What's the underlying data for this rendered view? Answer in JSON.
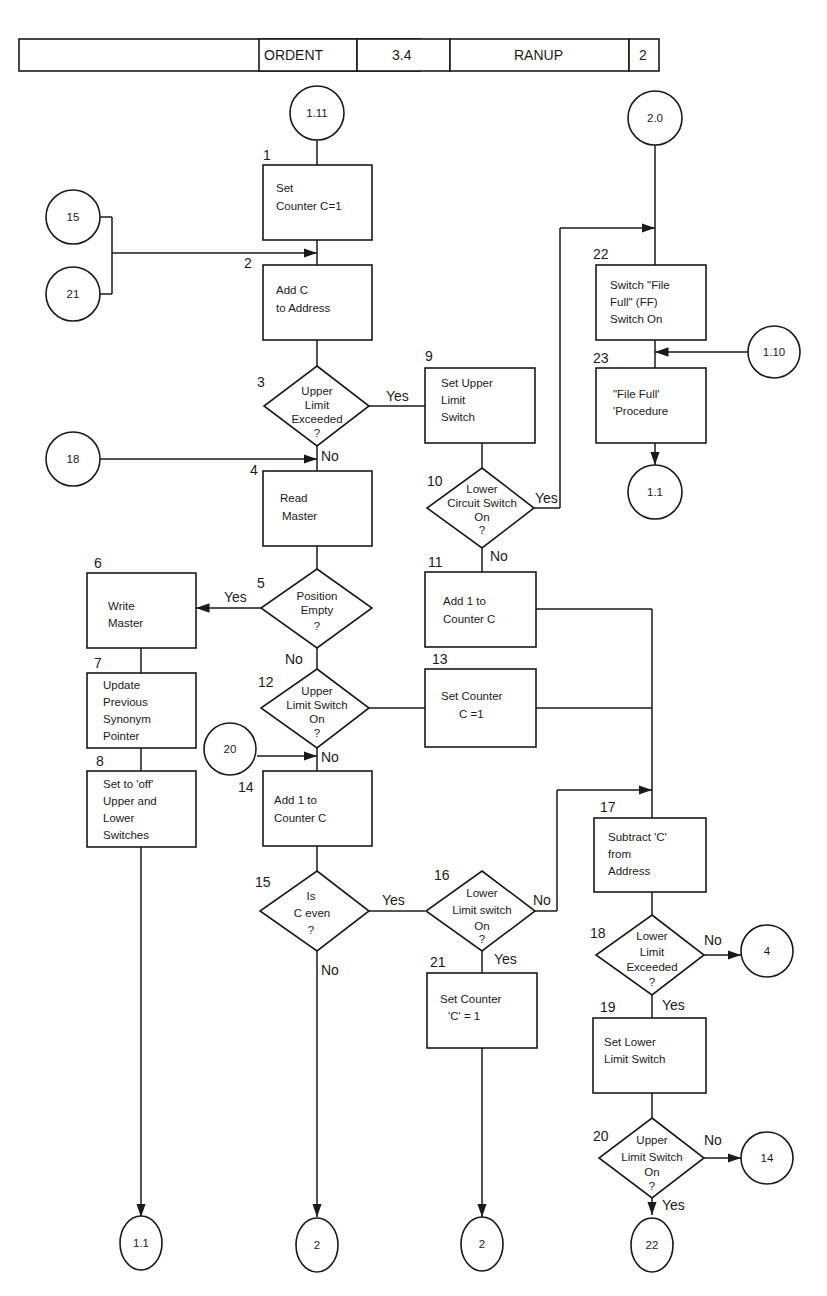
{
  "header": {
    "cells": [
      "",
      "ORDENT",
      "3.4",
      "RANUP",
      "2"
    ]
  },
  "connectors": {
    "c_1_11": "1.11",
    "c_2_0": "2.0",
    "c_15": "15",
    "c_21": "21",
    "c_18": "18",
    "c_1_10": "1.10",
    "c_1_1_top": "1.1",
    "c_20": "20",
    "c_4": "4",
    "c_14": "14",
    "c_1_1_bottom": "1.1",
    "c_2_a": "2",
    "c_2_b": "2",
    "c_22": "22"
  },
  "steps": {
    "s1": {
      "num": "1",
      "lines": [
        "Set",
        "Counter C=1"
      ]
    },
    "s2": {
      "num": "2",
      "lines": [
        "Add C",
        "to Address"
      ]
    },
    "s3": {
      "num": "3",
      "lines": [
        "Upper",
        "Limit",
        "Exceeded",
        "?"
      ]
    },
    "s4": {
      "num": "4",
      "lines": [
        "Read",
        "Master"
      ]
    },
    "s5": {
      "num": "5",
      "lines": [
        "Position",
        "Empty",
        "?"
      ]
    },
    "s6": {
      "num": "6",
      "lines": [
        "Write",
        "Master"
      ]
    },
    "s7": {
      "num": "7",
      "lines": [
        "Update",
        "Previous",
        "Synonym",
        "Pointer"
      ]
    },
    "s8": {
      "num": "8",
      "lines": [
        "Set to 'off'",
        "Upper and",
        "Lower",
        "Switches"
      ]
    },
    "s9": {
      "num": "9",
      "lines": [
        "Set Upper",
        "Limit",
        "Switch"
      ]
    },
    "s10": {
      "num": "10",
      "lines": [
        "Lower",
        "Circuit Switch",
        "On",
        "?"
      ]
    },
    "s11": {
      "num": "11",
      "lines": [
        "Add 1 to",
        "Counter C"
      ]
    },
    "s12": {
      "num": "12",
      "lines": [
        "Upper",
        "Limit Switch",
        "On",
        "?"
      ]
    },
    "s13": {
      "num": "13",
      "lines": [
        "Set Counter",
        "C =1"
      ]
    },
    "s14": {
      "num": "14",
      "lines": [
        "Add 1 to",
        "Counter C"
      ]
    },
    "s15": {
      "num": "15",
      "lines": [
        "Is",
        "C even",
        "?"
      ]
    },
    "s16": {
      "num": "16",
      "lines": [
        "Lower",
        "Limit switch",
        "On",
        "?"
      ]
    },
    "s17": {
      "num": "17",
      "lines": [
        "Subtract 'C'",
        "from",
        "Address"
      ]
    },
    "s18": {
      "num": "18",
      "lines": [
        "Lower",
        "Limit",
        "Exceeded",
        "?"
      ]
    },
    "s19": {
      "num": "19",
      "lines": [
        "Set Lower",
        "Limit Switch"
      ]
    },
    "s20": {
      "num": "20",
      "lines": [
        "Upper",
        "Limit Switch",
        "On",
        "?"
      ]
    },
    "s21": {
      "num": "21",
      "lines": [
        "Set Counter",
        "'C' = 1"
      ]
    },
    "s22": {
      "num": "22",
      "lines": [
        "Switch \"File",
        "Full\" (FF)",
        "Switch On"
      ]
    },
    "s23": {
      "num": "23",
      "lines": [
        "\"File Full'",
        "'Procedure"
      ]
    }
  },
  "branch_labels": {
    "yes": "Yes",
    "no": "No"
  }
}
